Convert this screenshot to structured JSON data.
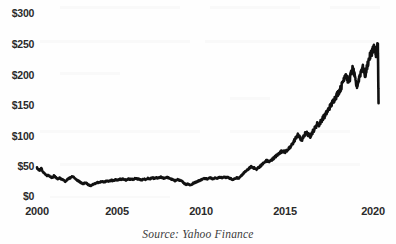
{
  "chart_data": {
    "type": "line",
    "title": "",
    "subtitle": "",
    "xlabel": "",
    "ylabel": "",
    "source_note": "Source: Yahoo Finance",
    "grid": false,
    "legend": "none",
    "line_color": "#111111",
    "background_color": "#ffffff",
    "text_color": "#2b2b2b",
    "xlim": [
      2000,
      2020.25
    ],
    "ylim": [
      0,
      300
    ],
    "y_ticks": [
      0,
      50,
      100,
      150,
      200,
      250,
      300
    ],
    "y_tick_labels": [
      "$0",
      "$50",
      "$100",
      "$150",
      "$200",
      "$250",
      "$300"
    ],
    "x_ticks": [
      2000,
      2005,
      2010,
      2015,
      2020
    ],
    "x_tick_labels": [
      "2000",
      "2005",
      "2010",
      "2015",
      "2020"
    ],
    "series": [
      {
        "name": "Share price",
        "units": "USD",
        "x": [
          2000.0,
          2000.08,
          2000.17,
          2000.25,
          2000.33,
          2000.42,
          2000.5,
          2000.58,
          2000.67,
          2000.75,
          2000.83,
          2000.92,
          2001.0,
          2001.08,
          2001.17,
          2001.25,
          2001.33,
          2001.42,
          2001.5,
          2001.58,
          2001.67,
          2001.75,
          2001.83,
          2001.92,
          2002.0,
          2002.08,
          2002.17,
          2002.25,
          2002.33,
          2002.42,
          2002.5,
          2002.58,
          2002.67,
          2002.75,
          2002.83,
          2002.92,
          2003.0,
          2003.08,
          2003.17,
          2003.25,
          2003.33,
          2003.42,
          2003.5,
          2003.58,
          2003.67,
          2003.75,
          2003.83,
          2003.92,
          2004.0,
          2004.08,
          2004.17,
          2004.25,
          2004.33,
          2004.42,
          2004.5,
          2004.58,
          2004.67,
          2004.75,
          2004.83,
          2004.92,
          2005.0,
          2005.08,
          2005.17,
          2005.25,
          2005.33,
          2005.42,
          2005.5,
          2005.58,
          2005.67,
          2005.75,
          2005.83,
          2005.92,
          2006.0,
          2006.08,
          2006.17,
          2006.25,
          2006.33,
          2006.42,
          2006.5,
          2006.58,
          2006.67,
          2006.75,
          2006.83,
          2006.92,
          2007.0,
          2007.08,
          2007.17,
          2007.25,
          2007.33,
          2007.42,
          2007.5,
          2007.58,
          2007.67,
          2007.75,
          2007.83,
          2007.92,
          2008.0,
          2008.08,
          2008.17,
          2008.25,
          2008.33,
          2008.42,
          2008.5,
          2008.58,
          2008.67,
          2008.75,
          2008.83,
          2008.92,
          2009.0,
          2009.08,
          2009.17,
          2009.25,
          2009.33,
          2009.42,
          2009.5,
          2009.58,
          2009.67,
          2009.75,
          2009.83,
          2009.92,
          2010.0,
          2010.08,
          2010.17,
          2010.25,
          2010.33,
          2010.42,
          2010.5,
          2010.58,
          2010.67,
          2010.75,
          2010.83,
          2010.92,
          2011.0,
          2011.08,
          2011.17,
          2011.25,
          2011.33,
          2011.42,
          2011.5,
          2011.58,
          2011.67,
          2011.75,
          2011.83,
          2011.92,
          2012.0,
          2012.08,
          2012.17,
          2012.25,
          2012.33,
          2012.42,
          2012.5,
          2012.58,
          2012.67,
          2012.75,
          2012.83,
          2012.92,
          2013.0,
          2013.08,
          2013.17,
          2013.25,
          2013.33,
          2013.42,
          2013.5,
          2013.58,
          2013.67,
          2013.75,
          2013.83,
          2013.92,
          2014.0,
          2014.08,
          2014.17,
          2014.25,
          2014.33,
          2014.42,
          2014.5,
          2014.58,
          2014.67,
          2014.75,
          2014.83,
          2014.92,
          2015.0,
          2015.08,
          2015.17,
          2015.25,
          2015.33,
          2015.42,
          2015.5,
          2015.58,
          2015.67,
          2015.75,
          2015.83,
          2015.92,
          2016.0,
          2016.08,
          2016.17,
          2016.25,
          2016.33,
          2016.42,
          2016.5,
          2016.58,
          2016.67,
          2016.75,
          2016.83,
          2016.92,
          2017.0,
          2017.08,
          2017.17,
          2017.25,
          2017.33,
          2017.42,
          2017.5,
          2017.58,
          2017.67,
          2017.75,
          2017.83,
          2017.92,
          2018.0,
          2018.08,
          2018.17,
          2018.25,
          2018.33,
          2018.42,
          2018.5,
          2018.58,
          2018.67,
          2018.75,
          2018.83,
          2018.92,
          2019.0,
          2019.08,
          2019.17,
          2019.25,
          2019.33,
          2019.42,
          2019.5,
          2019.58,
          2019.67,
          2019.75,
          2019.83,
          2019.92,
          2020.0,
          2020.04,
          2020.08,
          2020.12,
          2020.17,
          2020.19,
          2020.21
        ],
        "values": [
          46,
          44,
          42,
          45,
          41,
          38,
          36,
          33,
          34,
          32,
          31,
          30,
          33,
          31,
          29,
          27,
          30,
          28,
          27,
          26,
          24,
          26,
          28,
          29,
          30,
          32,
          31,
          29,
          27,
          25,
          24,
          22,
          21,
          20,
          22,
          21,
          19,
          18,
          17,
          18,
          19,
          20,
          21,
          22,
          22,
          23,
          24,
          23,
          23,
          24,
          25,
          24,
          25,
          26,
          25,
          26,
          27,
          26,
          27,
          28,
          27,
          28,
          27,
          26,
          27,
          28,
          27,
          28,
          27,
          28,
          29,
          28,
          28,
          27,
          26,
          27,
          28,
          27,
          28,
          29,
          28,
          29,
          30,
          29,
          29,
          30,
          29,
          30,
          31,
          30,
          29,
          30,
          31,
          30,
          29,
          28,
          27,
          26,
          25,
          26,
          27,
          26,
          25,
          24,
          22,
          20,
          19,
          20,
          19,
          18,
          19,
          21,
          22,
          23,
          24,
          25,
          26,
          27,
          28,
          29,
          29,
          28,
          29,
          30,
          29,
          28,
          29,
          30,
          29,
          30,
          31,
          30,
          30,
          31,
          30,
          31,
          30,
          29,
          28,
          27,
          28,
          29,
          30,
          29,
          30,
          33,
          36,
          38,
          40,
          42,
          44,
          46,
          48,
          47,
          46,
          45,
          44,
          46,
          48,
          50,
          52,
          54,
          56,
          58,
          57,
          56,
          58,
          60,
          62,
          64,
          66,
          68,
          70,
          72,
          74,
          73,
          72,
          74,
          76,
          78,
          80,
          84,
          88,
          92,
          96,
          100,
          98,
          94,
          92,
          96,
          100,
          104,
          102,
          100,
          98,
          102,
          106,
          110,
          114,
          118,
          116,
          120,
          124,
          128,
          130,
          134,
          138,
          142,
          146,
          150,
          154,
          158,
          162,
          166,
          170,
          174,
          178,
          186,
          194,
          202,
          196,
          188,
          192,
          200,
          208,
          202,
          190,
          180,
          186,
          196,
          204,
          212,
          206,
          198,
          208,
          218,
          226,
          232,
          238,
          244,
          240,
          232,
          238,
          244,
          246,
          198,
          152
        ]
      }
    ],
    "annotations": [
      {
        "label": "sharp decline at end of series",
        "x": 2020.2,
        "y": 152
      }
    ]
  },
  "axes": {
    "y_labels": [
      "$300",
      "$250",
      "$200",
      "$150",
      "$100",
      "$50",
      "$0"
    ],
    "x_labels": [
      "2000",
      "2005",
      "2010",
      "2015",
      "2020"
    ]
  },
  "caption": {
    "source": "Source: Yahoo Finance"
  }
}
